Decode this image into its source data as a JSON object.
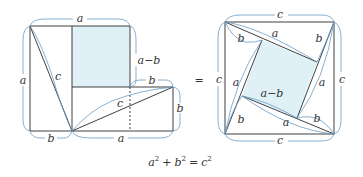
{
  "colors": {
    "line": "#2a2a2a",
    "brace": "#6a9cc4",
    "shade": "#dff1f6"
  },
  "left_figure": {
    "labels": {
      "top": "a",
      "left": "a",
      "diag_left": "c",
      "a_minus_b": "a−b",
      "b_top_right": "b",
      "diag_right": "c",
      "b_right": "b",
      "bottom_left": "b",
      "bottom_right": "a"
    }
  },
  "equals": "=",
  "right_figure": {
    "labels": {
      "top": "c",
      "left": "c",
      "right": "c",
      "bottom": "c",
      "b_tl": "b",
      "a_top": "a",
      "b_tr": "b",
      "a_right": "a",
      "a_left": "a",
      "a_minus_b": "a−b",
      "b_bl": "b",
      "a_bottom": "a",
      "b_br": "b"
    }
  },
  "equation": {
    "lhs_a": "a",
    "sup1": "2",
    "plus": "+",
    "lhs_b": "b",
    "sup2": "2",
    "eq": "=",
    "rhs_c": "c",
    "sup3": "2"
  }
}
